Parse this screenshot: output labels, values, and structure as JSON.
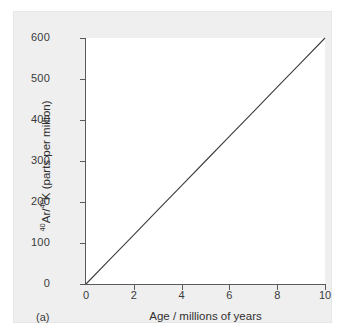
{
  "figure": {
    "panel_label": "(a)",
    "background_color": "#efefef",
    "plot_background_color": "#ffffff",
    "axis_color": "#5a5a5a",
    "line_color": "#3c3c3c"
  },
  "chart_data": {
    "type": "line",
    "title": "",
    "subtitle": "",
    "xlabel": "Age / millions of years",
    "ylabel_parts": {
      "sup1": "40",
      "text1": "Ar/",
      "sup2": "40",
      "text2": "K (parts per million)"
    },
    "ylabel_plain": "40Ar/40K (parts per million)",
    "xlim": [
      0,
      10
    ],
    "ylim": [
      0,
      600
    ],
    "xticks": [
      0,
      2,
      4,
      6,
      8,
      10
    ],
    "xtick_labels": [
      "0",
      "2",
      "4",
      "6",
      "8",
      "10"
    ],
    "yticks": [
      0,
      100,
      200,
      300,
      400,
      500,
      600
    ],
    "ytick_labels": [
      "0",
      "100",
      "200",
      "300",
      "400",
      "500",
      "600"
    ],
    "grid": false,
    "legend": false,
    "legend_position": "none",
    "annotations": [
      "(a)"
    ],
    "series": [
      {
        "name": "40Ar/40K ratio vs age",
        "slope_ppm_per_million_years": 60,
        "intercept": 0,
        "x": [
          0,
          1,
          2,
          3,
          4,
          5,
          6,
          7,
          8,
          9,
          10
        ],
        "values": [
          0,
          60,
          120,
          180,
          240,
          300,
          360,
          420,
          480,
          540,
          600
        ]
      }
    ]
  }
}
